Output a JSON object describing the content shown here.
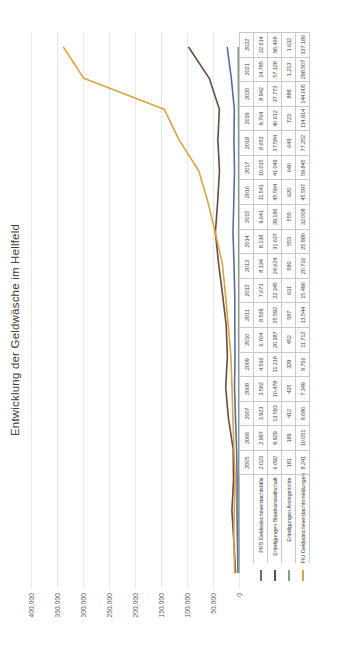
{
  "chart_data": {
    "type": "line",
    "title": "Entwicklung der Geldwäsche im Hellfeld",
    "xlabel": "",
    "ylabel": "",
    "ylim": [
      0,
      400000
    ],
    "grid": true,
    "legend_position": "table-row-headers",
    "yticks": [
      "0",
      "50.000",
      "100.000",
      "150.000",
      "200.000",
      "250.000",
      "300.000",
      "350.000",
      "400.000"
    ],
    "ytick_values": [
      0,
      50000,
      100000,
      150000,
      200000,
      250000,
      300000,
      350000,
      400000
    ],
    "categories": [
      "2005",
      "2006",
      "2007",
      "2008",
      "2009",
      "2010",
      "2011",
      "2012",
      "2013",
      "2014",
      "2015",
      "2016",
      "2017",
      "2018",
      "2019",
      "2020",
      "2021",
      "2022"
    ],
    "series": [
      {
        "name": "PKS Geldwäscheverdachtsfälle",
        "color": "#5B6B9E",
        "values": [
          2023,
          2997,
          3923,
          3582,
          4566,
          6764,
          8569,
          7673,
          8134,
          8138,
          9641,
          11541,
          10015,
          8652,
          9764,
          8942,
          14785,
          22614
        ],
        "labels": [
          "2.023",
          "2.997",
          "3.923",
          "3.582",
          "4.566",
          "6.764",
          "8.569",
          "7.673",
          "8.134",
          "8.138",
          "9.641",
          "11.541",
          "10.015",
          "8.652",
          "9.764",
          "8.942",
          "14.785",
          "22.614"
        ]
      },
      {
        "name": "Erledigungen Staatsanwaltschaft",
        "color": "#6B4B3E",
        "values": [
          6692,
          9929,
          13593,
          10478,
          11218,
          20387,
          25592,
          22345,
          24624,
          31637,
          39186,
          45504,
          41049,
          37584,
          40612,
          37773,
          57128,
          96468
        ],
        "labels": [
          "6.692",
          "9.929",
          "13.593",
          "10.478",
          "11.218",
          "20.387",
          "25.592",
          "22.345",
          "24.624",
          "31.637",
          "39.186",
          "45.504",
          "41.049",
          "37.584",
          "40.612",
          "37.773",
          "57.128",
          "96.468"
        ]
      },
      {
        "name": "Erledigungen Amtsgerichte",
        "color": "#8A9A8C",
        "values": [
          181,
          189,
          412,
          425,
          329,
          452,
          587,
          631,
          580,
          553,
          555,
          620,
          640,
          649,
          723,
          888,
          1213,
          1632
        ],
        "labels": [
          "181",
          "189",
          "412",
          "425",
          "329",
          "452",
          "587",
          "631",
          "580",
          "553",
          "555",
          "620",
          "640",
          "649",
          "723",
          "888",
          "1.213",
          "1.632"
        ]
      },
      {
        "name": "FIU Geldwäscheverdachtsmeldungen",
        "color": "#D9A441",
        "values": [
          8241,
          10051,
          9080,
          7349,
          9756,
          11712,
          13544,
          15496,
          20716,
          25980,
          32008,
          45597,
          59845,
          77252,
          114914,
          144005,
          298507,
          337186
        ],
        "labels": [
          "8.241",
          "10.051",
          "9.080",
          "7.349",
          "9.756",
          "11.712",
          "13.544",
          "15.496",
          "20.716",
          "25.980",
          "32.008",
          "45.597",
          "59.845",
          "77.252",
          "114.914",
          "144.005",
          "298.507",
          "337.186"
        ]
      }
    ]
  }
}
